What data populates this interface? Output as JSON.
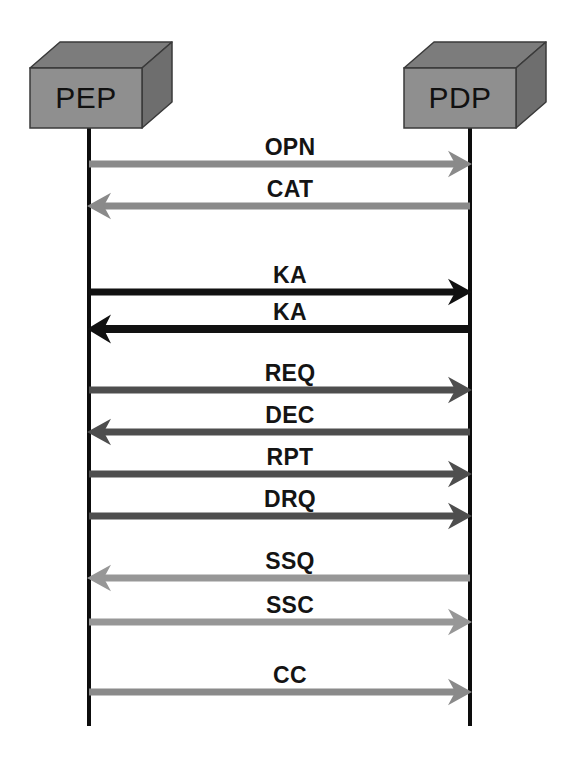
{
  "diagram": {
    "type": "sequence-diagram",
    "canvas": {
      "width": 579,
      "height": 764
    },
    "background_color": "#ffffff"
  },
  "nodes": [
    {
      "id": "pep",
      "label": "PEP",
      "shape": "3d-box",
      "face_color": "#8f8f8f",
      "top_color": "#7c7c7c",
      "side_color": "#6e6e6e",
      "edge_color": "#3a3a3a",
      "front": {
        "x": 30,
        "y": 68,
        "w": 112,
        "h": 60
      },
      "depth": {
        "dx": 30,
        "dy": -26
      },
      "label_x": 86,
      "label_y": 108,
      "lifeline_x": 89,
      "lifeline_top": 128,
      "lifeline_bottom": 726
    },
    {
      "id": "pdp",
      "label": "PDP",
      "shape": "3d-box",
      "face_color": "#8f8f8f",
      "top_color": "#7c7c7c",
      "side_color": "#6e6e6e",
      "edge_color": "#3a3a3a",
      "front": {
        "x": 404,
        "y": 68,
        "w": 112,
        "h": 60
      },
      "depth": {
        "dx": 30,
        "dy": -26
      },
      "label_x": 460,
      "label_y": 108,
      "lifeline_x": 470,
      "lifeline_top": 128,
      "lifeline_bottom": 726
    }
  ],
  "lifeline_color": "#0d0d0d",
  "lifeline_width": 4,
  "messages": [
    {
      "label": "OPN",
      "direction": "right",
      "from": "pep",
      "to": "pdp",
      "y": 164,
      "label_y": 155,
      "color": "#8a8a8a",
      "thickness": 7
    },
    {
      "label": "CAT",
      "direction": "left",
      "from": "pdp",
      "to": "pep",
      "y": 206,
      "label_y": 197,
      "color": "#8a8a8a",
      "thickness": 7
    },
    {
      "label": "KA",
      "direction": "right",
      "from": "pep",
      "to": "pdp",
      "y": 292,
      "label_y": 283,
      "color": "#111111",
      "thickness": 7
    },
    {
      "label": "KA",
      "direction": "left",
      "from": "pdp",
      "to": "pep",
      "y": 329,
      "label_y": 320,
      "color": "#111111",
      "thickness": 8
    },
    {
      "label": "REQ",
      "direction": "right",
      "from": "pep",
      "to": "pdp",
      "y": 390,
      "label_y": 381,
      "color": "#4e4e4e",
      "thickness": 7
    },
    {
      "label": "DEC",
      "direction": "left",
      "from": "pdp",
      "to": "pep",
      "y": 432,
      "label_y": 423,
      "color": "#4e4e4e",
      "thickness": 7
    },
    {
      "label": "RPT",
      "direction": "right",
      "from": "pep",
      "to": "pdp",
      "y": 474,
      "label_y": 465,
      "color": "#4e4e4e",
      "thickness": 7
    },
    {
      "label": "DRQ",
      "direction": "right",
      "from": "pep",
      "to": "pdp",
      "y": 516,
      "label_y": 507,
      "color": "#4e4e4e",
      "thickness": 7
    },
    {
      "label": "SSQ",
      "direction": "left",
      "from": "pdp",
      "to": "pep",
      "y": 578,
      "label_y": 569,
      "color": "#979797",
      "thickness": 7
    },
    {
      "label": "SSC",
      "direction": "right",
      "from": "pep",
      "to": "pdp",
      "y": 622,
      "label_y": 613,
      "color": "#979797",
      "thickness": 7
    },
    {
      "label": "CC",
      "direction": "right",
      "from": "pep",
      "to": "pdp",
      "y": 692,
      "label_y": 683,
      "color": "#8a8a8a",
      "thickness": 7
    }
  ],
  "message_label_x": 290
}
